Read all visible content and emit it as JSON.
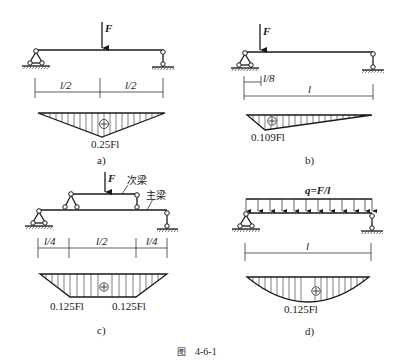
{
  "figure": {
    "caption_prefix": "图",
    "caption_number": "4-6-1"
  },
  "panels": [
    {
      "id": "a",
      "label": "a)",
      "load": {
        "type": "point",
        "name": "F",
        "position": "midspan"
      },
      "dimensions": [
        "l/2",
        "l/2"
      ],
      "moment_diagram": {
        "shape": "triangle",
        "sign": "+",
        "max_label": "0.25Fl"
      }
    },
    {
      "id": "b",
      "label": "b)",
      "load": {
        "type": "point",
        "name": "F",
        "position": "l/8 from left support"
      },
      "dimensions": [
        "l/8",
        "l"
      ],
      "moment_diagram": {
        "shape": "triangle",
        "sign": "+",
        "max_label": "0.109Fl"
      }
    },
    {
      "id": "c",
      "label": "c)",
      "load": {
        "type": "point",
        "name": "F",
        "position": "midspan of secondary beam"
      },
      "beam_labels": {
        "secondary": "次梁",
        "main": "主梁"
      },
      "dimensions": [
        "l/4",
        "l/2",
        "l/4"
      ],
      "moment_diagram": {
        "shape": "trapezoid",
        "sign": "+",
        "left_label": "0.125Fl",
        "right_label": "0.125Fl"
      }
    },
    {
      "id": "d",
      "label": "d)",
      "load": {
        "type": "uniform",
        "name": "q=F/l"
      },
      "dimensions": [
        "l"
      ],
      "moment_diagram": {
        "shape": "parabola",
        "sign": "+",
        "max_label": "0.125Fl"
      }
    }
  ],
  "symbols": {
    "force": "F",
    "plus": "+"
  }
}
